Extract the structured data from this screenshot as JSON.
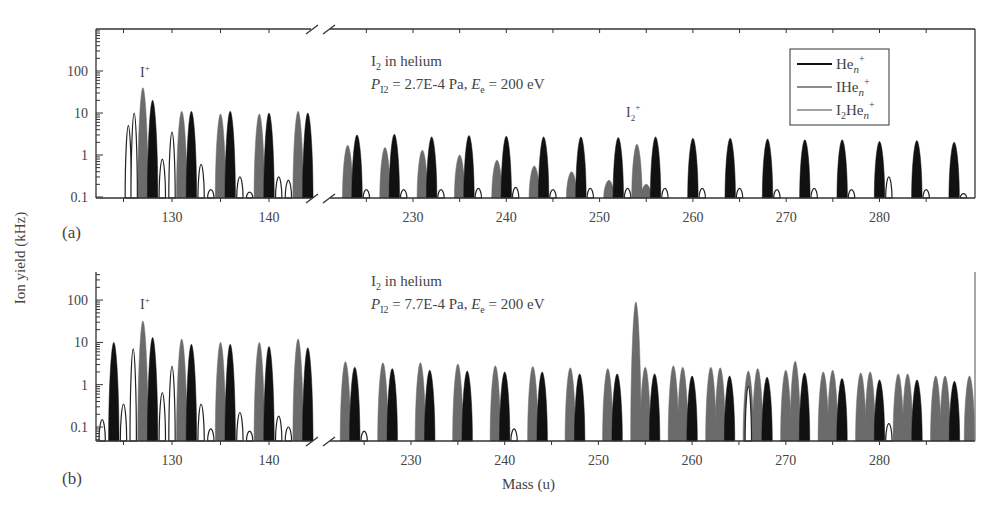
{
  "chart_data": {
    "type": "bar",
    "ylabel": "Ion yield (kHz)",
    "xlabel": "Mass (u)",
    "yscale": "log",
    "legend": {
      "position": "top-right (panel a)",
      "entries": [
        {
          "label": "He",
          "sub": "n",
          "sup": "+",
          "color": "#111111"
        },
        {
          "label": "IHe",
          "sub": "n",
          "sup": "+",
          "color": "#6b6b6b"
        },
        {
          "label": "I",
          "sub2": "2",
          "label2": "He",
          "sub": "n",
          "sup": "+",
          "color": "#222222",
          "style": "outline"
        }
      ]
    },
    "panels": [
      {
        "id": "a",
        "panel_label": "(a)",
        "title_line1": "I",
        "title_line1_sub": "2",
        "title_line1_rest": " in helium",
        "title_line2_P": "P",
        "title_line2_Psub": "I2",
        "title_line2_mid": " = 2.7E-4 Pa, ",
        "title_line2_E": "E",
        "title_line2_Esub": "e",
        "title_line2_end": " =  200 eV",
        "annotations": [
          {
            "text": "I",
            "sup": "+",
            "mass": 127
          },
          {
            "text": "I",
            "sub": "2",
            "sup": "+",
            "mass": 254
          }
        ],
        "yticks": [
          "100",
          "10",
          "1",
          "0.1"
        ],
        "ylim": [
          0.1,
          800
        ],
        "segments": [
          {
            "xrange": [
              122,
              144.5
            ],
            "xticks": [
              130,
              140
            ]
          },
          {
            "xrange": [
              221.5,
              289.5
            ],
            "xticks": [
              230,
              240,
              250,
              260,
              270,
              280
            ]
          }
        ],
        "series": [
          {
            "name": "IHen+",
            "color": "#6b6b6b",
            "peaks": [
              [
                127,
                40
              ],
              [
                131,
                11
              ],
              [
                135,
                9.5
              ],
              [
                139,
                9.5
              ],
              [
                143,
                11
              ],
              [
                223,
                1.7
              ],
              [
                227,
                1.5
              ],
              [
                231,
                1.3
              ],
              [
                235,
                1.0
              ],
              [
                239,
                0.75
              ],
              [
                243,
                0.55
              ],
              [
                247,
                0.4
              ],
              [
                251,
                0.25
              ],
              [
                254,
                1.8
              ],
              [
                255,
                0.2
              ]
            ]
          },
          {
            "name": "Hen+",
            "color": "#111111",
            "peaks": [
              [
                128,
                20
              ],
              [
                132,
                11
              ],
              [
                136,
                11
              ],
              [
                140,
                10
              ],
              [
                144,
                10
              ],
              [
                224,
                3.0
              ],
              [
                228,
                3.1
              ],
              [
                232,
                2.7
              ],
              [
                236,
                2.9
              ],
              [
                240,
                2.8
              ],
              [
                244,
                2.7
              ],
              [
                248,
                2.7
              ],
              [
                252,
                2.6
              ],
              [
                256,
                2.7
              ],
              [
                260,
                2.5
              ],
              [
                264,
                2.5
              ],
              [
                268,
                2.4
              ],
              [
                272,
                2.3
              ],
              [
                276,
                2.3
              ],
              [
                280,
                2.1
              ],
              [
                284,
                2.2
              ],
              [
                288,
                2.0
              ]
            ]
          },
          {
            "name": "I2Hen+",
            "color": "#222222",
            "style": "outline",
            "peaks": [
              [
                125.5,
                5
              ],
              [
                126.1,
                10
              ],
              [
                129,
                0.8
              ],
              [
                130,
                3.5
              ],
              [
                133,
                0.6
              ],
              [
                134,
                0.15
              ],
              [
                137,
                0.3
              ],
              [
                138,
                0.13
              ],
              [
                141,
                0.3
              ],
              [
                142,
                0.25
              ],
              [
                225,
                0.15
              ],
              [
                229,
                0.15
              ],
              [
                233,
                0.15
              ],
              [
                237,
                0.16
              ],
              [
                241,
                0.17
              ],
              [
                245,
                0.15
              ],
              [
                249,
                0.16
              ],
              [
                253,
                0.16
              ],
              [
                257,
                0.16
              ],
              [
                261,
                0.16
              ],
              [
                265,
                0.16
              ],
              [
                269,
                0.15
              ],
              [
                273,
                0.16
              ],
              [
                277,
                0.15
              ],
              [
                281,
                0.3
              ],
              [
                285,
                0.15
              ],
              [
                289,
                0.12
              ]
            ]
          }
        ]
      },
      {
        "id": "b",
        "panel_label": "(b)",
        "title_line1": "I",
        "title_line1_sub": "2",
        "title_line1_rest": " in helium",
        "title_line2_P": "P",
        "title_line2_Psub": "I2",
        "title_line2_mid": " = 7.7E-4 Pa, ",
        "title_line2_E": "E",
        "title_line2_Esub": "e",
        "title_line2_end": " = 200 eV",
        "annotations": [
          {
            "text": "I",
            "sup": "+",
            "mass": 127
          }
        ],
        "yticks": [
          "100",
          "10",
          "1",
          "0.1"
        ],
        "ylim": [
          0.05,
          800
        ],
        "segments": [
          {
            "xrange": [
              122,
              144.5
            ],
            "xticks": [
              130,
              140
            ]
          },
          {
            "xrange": [
              221.5,
              289.5
            ],
            "xticks": [
              230,
              240,
              250,
              260,
              270,
              280
            ]
          }
        ],
        "series": [
          {
            "name": "IHen+",
            "color": "#6b6b6b",
            "peaks": [
              [
                127,
                32
              ],
              [
                131,
                12
              ],
              [
                135,
                10
              ],
              [
                139,
                10
              ],
              [
                143,
                12
              ],
              [
                223,
                3.5
              ],
              [
                227,
                3.3
              ],
              [
                231,
                3.3
              ],
              [
                235,
                3.1
              ],
              [
                239,
                2.8
              ],
              [
                243,
                2.7
              ],
              [
                247,
                2.5
              ],
              [
                251,
                2.4
              ],
              [
                254,
                90
              ],
              [
                255,
                2.6
              ],
              [
                258,
                2.8
              ],
              [
                259,
                2.6
              ],
              [
                262,
                2.6
              ],
              [
                263,
                2.5
              ],
              [
                266,
                2.1
              ],
              [
                267,
                2.4
              ],
              [
                270,
                2.2
              ],
              [
                271,
                3.6
              ],
              [
                274,
                2.0
              ],
              [
                275,
                2.2
              ],
              [
                278,
                1.9
              ],
              [
                279,
                2.0
              ],
              [
                282,
                1.8
              ],
              [
                283,
                1.8
              ],
              [
                286,
                1.6
              ],
              [
                287,
                1.6
              ],
              [
                289.6,
                1.6
              ]
            ]
          },
          {
            "name": "Hen+",
            "color": "#111111",
            "peaks": [
              [
                124,
                10
              ],
              [
                128,
                13
              ],
              [
                132,
                9
              ],
              [
                136,
                9
              ],
              [
                140,
                8
              ],
              [
                144,
                7.5
              ],
              [
                224,
                2.6
              ],
              [
                228,
                2.4
              ],
              [
                232,
                2.2
              ],
              [
                236,
                2.1
              ],
              [
                240,
                2.0
              ],
              [
                244,
                2.0
              ],
              [
                248,
                1.8
              ],
              [
                252,
                1.8
              ],
              [
                256,
                1.8
              ],
              [
                260,
                1.6
              ],
              [
                264,
                1.6
              ],
              [
                268,
                1.5
              ],
              [
                272,
                1.9
              ],
              [
                276,
                1.4
              ],
              [
                280,
                1.3
              ],
              [
                284,
                1.3
              ],
              [
                288,
                1.2
              ]
            ]
          },
          {
            "name": "I2Hen+",
            "color": "#222222",
            "style": "outline",
            "peaks": [
              [
                122.8,
                0.15
              ],
              [
                125,
                0.35
              ],
              [
                126,
                7
              ],
              [
                129,
                0.65
              ],
              [
                130,
                2.7
              ],
              [
                133,
                0.35
              ],
              [
                134,
                0.09
              ],
              [
                137,
                0.22
              ],
              [
                138,
                0.08
              ],
              [
                141,
                0.18
              ],
              [
                142,
                0.1
              ],
              [
                225,
                0.08
              ],
              [
                241,
                0.09
              ],
              [
                266,
                0.9
              ],
              [
                281,
                0.12
              ]
            ]
          }
        ]
      }
    ]
  },
  "axis_labels": {
    "y": "Ion yield (kHz)",
    "x": "Mass (u)"
  },
  "legend": {
    "item1": "He",
    "item2": "IHe",
    "item3_pre": "I",
    "item3_sub": "2",
    "item3_post": "He",
    "sub_n": "n",
    "sup_plus": "+"
  },
  "panel_a": {
    "label": "(a)",
    "title1_a": "I",
    "title1_sub": "2",
    "title1_b": " in helium",
    "title2": "P",
    "title2_sub": "I2",
    "title2_mid": " = 2.7E-4 Pa, ",
    "title2_E": "E",
    "title2_Esub": "e",
    "title2_end": " =  200 eV",
    "ion_label": "I",
    "ion_sup": "+",
    "i2_label": "I",
    "i2_sub": "2",
    "i2_sup": "+"
  },
  "panel_b": {
    "label": "(b)",
    "title1_a": "I",
    "title1_sub": "2",
    "title1_b": " in helium",
    "title2": "P",
    "title2_sub": "I2",
    "title2_mid": " = 7.7E-4 Pa, ",
    "title2_E": "E",
    "title2_Esub": "e",
    "title2_end": " = 200 eV",
    "ion_label": "I",
    "ion_sup": "+"
  },
  "ticks": {
    "y": [
      "100",
      "10",
      "1",
      "0.1"
    ],
    "x_seg1": [
      "130",
      "140"
    ],
    "x_seg2": [
      "230",
      "240",
      "250",
      "260",
      "270",
      "280"
    ]
  }
}
